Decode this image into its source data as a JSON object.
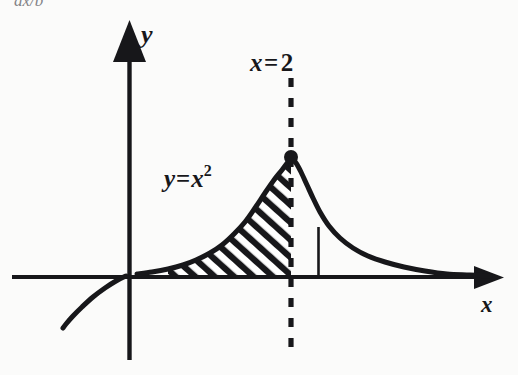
{
  "figure": {
    "title_fragment": "ax/b",
    "background_color": "#fbfbfa",
    "ink_color": "#17171a",
    "labels": {
      "y_axis": "y",
      "x_axis": "x",
      "vertical_line": {
        "var": "x",
        "operator": "=",
        "value": "2",
        "full": "x=2"
      },
      "curve": {
        "lhs": "y",
        "operator": "=",
        "base": "x",
        "exponent": "2",
        "full": "y=x2"
      }
    }
  },
  "chart_data": {
    "type": "line",
    "title": "",
    "xlabel": "x",
    "ylabel": "y",
    "grid": false,
    "legend": false,
    "annotations": [
      {
        "name": "curve-label",
        "text": "y=x2",
        "x_px": 164,
        "y_px": 165
      },
      {
        "name": "vertical-line-label",
        "text": "x=2",
        "x_px": 250,
        "y_px": 50
      }
    ],
    "axes": {
      "origin_px": {
        "x": 129,
        "y": 277
      },
      "x_axis_px": {
        "x1": 12,
        "x2": 497,
        "y": 277,
        "arrow": "right"
      },
      "y_axis_px": {
        "x": 129,
        "y1": 30,
        "y2": 360,
        "arrow": "up"
      }
    },
    "series": [
      {
        "name": "main-curve",
        "description": "peaked decay curve with maximum at x=2",
        "points_px": [
          [
            137,
            274
          ],
          [
            152,
            272
          ],
          [
            168,
            269
          ],
          [
            183,
            265
          ],
          [
            196,
            260
          ],
          [
            210,
            253
          ],
          [
            222,
            245
          ],
          [
            234,
            234
          ],
          [
            245,
            222
          ],
          [
            255,
            208
          ],
          [
            265,
            193
          ],
          [
            274,
            180
          ],
          [
            282,
            170
          ],
          [
            288,
            162
          ],
          [
            291,
            158
          ],
          [
            296,
            163
          ],
          [
            301,
            172
          ],
          [
            307,
            185
          ],
          [
            313,
            198
          ],
          [
            320,
            212
          ],
          [
            329,
            226
          ],
          [
            340,
            238
          ],
          [
            353,
            248
          ],
          [
            368,
            256
          ],
          [
            385,
            262
          ],
          [
            404,
            267
          ],
          [
            425,
            271
          ],
          [
            447,
            274
          ],
          [
            470,
            275
          ],
          [
            490,
            276
          ]
        ]
      },
      {
        "name": "left-branch",
        "description": "short branch below axis left of y-axis",
        "points_px": [
          [
            126,
            276
          ],
          [
            116,
            281
          ],
          [
            105,
            288
          ],
          [
            93,
            297
          ],
          [
            82,
            307
          ],
          [
            73,
            316
          ],
          [
            66,
            324
          ],
          [
            63,
            328
          ]
        ]
      }
    ],
    "markers": [
      {
        "name": "peak-point",
        "x_px": 291,
        "y_px": 157,
        "radius_px": 7,
        "filled": true
      }
    ],
    "vertical_lines": [
      {
        "name": "x-equals-2-dashed",
        "x_px": 291,
        "y_top_px": 78,
        "y_bottom_px": 348,
        "style": "dashed",
        "label": "x=2"
      },
      {
        "name": "ordinate-segment",
        "x_px": 318,
        "y_top_px": 227,
        "y_bottom_px": 277,
        "style": "solid",
        "label": ""
      }
    ],
    "shaded_regions": [
      {
        "name": "hatched-area-under-curve",
        "style": "diagonal-hatch",
        "hatch_angle_deg": 45,
        "hatch_spacing_px": 13,
        "x_from_px": 158,
        "x_to_px": 291,
        "bounded_above_by": "main-curve",
        "bounded_below_by": "x-axis"
      }
    ]
  }
}
